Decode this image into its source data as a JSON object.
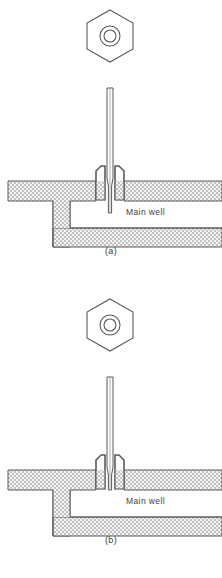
{
  "figure": {
    "background_color": "#ffffff",
    "line_color": "#555555",
    "hatch_color": "#b9b9b9",
    "hatch_background": "#f2f2f2",
    "text_color": "#3f3f3f"
  },
  "panels": [
    {
      "id": "a",
      "caption": "(a)",
      "well_label": "Main well",
      "nut": {
        "shape": "hexagon",
        "inner_rings": 2,
        "center_x": 110,
        "center_y": 36,
        "radius": 27
      },
      "needle": {
        "top_y": 88,
        "tip_y": 213,
        "tip_extends_into_well": true,
        "outer_width": 6,
        "bore_width": 2
      },
      "ferrule": {
        "top_y": 166,
        "bottom_y": 200,
        "left_x": 84,
        "right_x": 136
      }
    },
    {
      "id": "b",
      "caption": "(b)",
      "well_label": "Main well",
      "nut": {
        "shape": "hexagon",
        "inner_rings": 2,
        "center_x": 110,
        "center_y": 36,
        "radius": 27
      },
      "needle": {
        "top_y": 88,
        "tip_y": 201,
        "tip_extends_into_well": false,
        "outer_width": 6,
        "bore_width": 2
      },
      "ferrule": {
        "top_y": 166,
        "bottom_y": 200,
        "left_x": 84,
        "right_x": 136
      }
    }
  ],
  "block": {
    "top_slab_top_y": 181,
    "top_slab_bottom_y": 201,
    "bottom_slab_top_y": 228,
    "bottom_slab_bottom_y": 247,
    "left_wall_x": 53,
    "left_wall_inner_x": 70,
    "well_left_x": 70,
    "well_right_x": 222,
    "right_edge_x": 222
  }
}
